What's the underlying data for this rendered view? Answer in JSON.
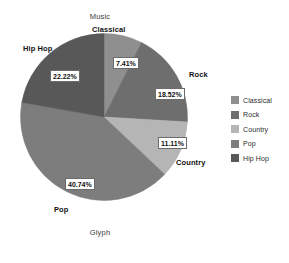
{
  "chart_data": {
    "type": "pie",
    "title": "Music",
    "xlabel": "Glyph",
    "ylabel": "",
    "legend_position": "right",
    "grid": false,
    "categories": [
      "Classical",
      "Rock",
      "Country",
      "Pop",
      "Hip Hop"
    ],
    "values": [
      7.41,
      18.52,
      11.11,
      40.74,
      22.22
    ],
    "value_labels": [
      "7.41%",
      "18.52%",
      "11.11%",
      "40.74%",
      "22.22%"
    ],
    "colors": [
      "#8f8f8f",
      "#6e6e6e",
      "#b5b5b5",
      "#7d7d7d",
      "#585858"
    ],
    "slices": [
      {
        "label": "Classical",
        "value": 7.41,
        "value_label": "7.41%",
        "color": "#8f8f8f"
      },
      {
        "label": "Rock",
        "value": 18.52,
        "value_label": "18.52%",
        "color": "#6e6e6e"
      },
      {
        "label": "Country",
        "value": 11.11,
        "value_label": "11.11%",
        "color": "#b5b5b5"
      },
      {
        "label": "Pop",
        "value": 40.74,
        "value_label": "40.74%",
        "color": "#7d7d7d"
      },
      {
        "label": "Hip Hop",
        "value": 22.22,
        "value_label": "22.22%",
        "color": "#585858"
      }
    ]
  },
  "legend": {
    "items": [
      {
        "label": "Classical",
        "color": "#8f8f8f"
      },
      {
        "label": "Rock",
        "color": "#6e6e6e"
      },
      {
        "label": "Country",
        "color": "#b5b5b5"
      },
      {
        "label": "Pop",
        "color": "#7d7d7d"
      },
      {
        "label": "Hip Hop",
        "color": "#585858"
      }
    ]
  }
}
